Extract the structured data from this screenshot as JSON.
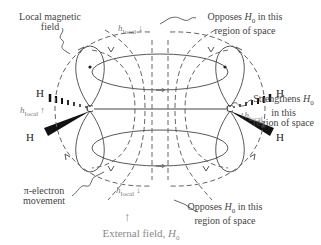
{
  "diagram": {
    "labels": {
      "local_field_line1": "Local magnetic",
      "local_field_line2": "field",
      "opposes_top_line1_pre": "Opposes ",
      "opposes_top_H": "H",
      "opposes_top_sub": "0",
      "opposes_top_line1_post": " in this",
      "opposes_top_line2": "region of space",
      "strengthens_line1_pre": "Strengthens ",
      "strengthens_H": "H",
      "strengthens_sub": "0",
      "strengthens_line2": "in this",
      "strengthens_line3": "region of space",
      "pi_line1": "π-electron",
      "pi_line2": "movement",
      "opposes_bottom_line1_pre": "Opposes ",
      "opposes_bottom_H": "H",
      "opposes_bottom_sub": "0",
      "opposes_bottom_line1_post": " in this",
      "opposes_bottom_line2": "region of space",
      "external_pre": "External field, ",
      "external_H": "H",
      "external_sub": "0"
    },
    "h_local": {
      "h": "h",
      "sub": "local",
      "top_arrow": "↓",
      "left_arrow": "↑",
      "right_arrow": "↑",
      "bottom_arrow": "↓"
    },
    "atoms": {
      "carbon_left": "C",
      "carbon_right": "C",
      "h_top_left": "H",
      "h_bottom_left": "H",
      "h_top_right": "H",
      "h_bottom_right": "H"
    },
    "external_arrow": "↑",
    "colors": {
      "line": "#555555",
      "dash": "#666666",
      "text": "#444444",
      "muted": "#8a8a8a"
    }
  }
}
